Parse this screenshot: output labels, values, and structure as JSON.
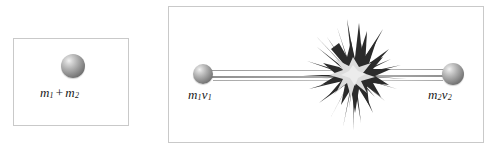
{
  "figure": {
    "type": "physics-collision-diagram",
    "background_color": "#ffffff",
    "border_color": "#c9c9c9"
  },
  "panels": {
    "left": {
      "name": "combined-mass-panel",
      "sphere": {
        "name": "combined-mass-sphere",
        "color": "#8e8e8e",
        "highlight_color": "#f2f2f2"
      },
      "label": {
        "m_first": "m",
        "m_first_sub": "1",
        "operator": "+",
        "m_second": "m",
        "m_second_sub": "2"
      }
    },
    "right": {
      "name": "collision-panel",
      "left_object": {
        "name": "mass-one",
        "label_symbol": "m",
        "label_sub_mass": "1",
        "label_velocity": "v",
        "label_sub_velocity": "1",
        "color": "#8e8e8e",
        "direction": "right"
      },
      "right_object": {
        "name": "mass-two",
        "label_symbol": "m",
        "label_sub_mass": "2",
        "label_velocity": "v",
        "label_sub_velocity": "2",
        "color": "#8e8e8e",
        "direction": "left"
      },
      "explosion": {
        "name": "collision-starburst",
        "spike_color": "#2b2b2b",
        "core_color": "#dcdcdc"
      },
      "motion_trail_color": "#9a9a9a"
    }
  }
}
